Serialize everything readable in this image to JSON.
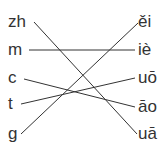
{
  "diagram": {
    "type": "pinyin-matching",
    "left": [
      {
        "label": "zh",
        "y": 12
      },
      {
        "label": "m",
        "y": 40
      },
      {
        "label": "c",
        "y": 68
      },
      {
        "label": "t",
        "y": 94
      },
      {
        "label": "g",
        "y": 124
      }
    ],
    "right": [
      {
        "label": "ěi",
        "y": 12
      },
      {
        "label": "iè",
        "y": 40
      },
      {
        "label": "uō",
        "y": 68
      },
      {
        "label": "āo",
        "y": 97
      },
      {
        "label": "uā",
        "y": 124
      }
    ],
    "connections": [
      {
        "from": "zh",
        "to": "uā"
      },
      {
        "from": "m",
        "to": "iè"
      },
      {
        "from": "c",
        "to": "āo"
      },
      {
        "from": "t",
        "to": "uō"
      },
      {
        "from": "g",
        "to": "ěi"
      }
    ],
    "line_color": "#333333"
  }
}
